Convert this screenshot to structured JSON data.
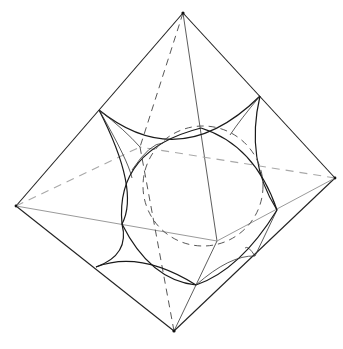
{
  "figure": {
    "title": "",
    "colors": {
      "line": "#222222",
      "hidden_light": "#a8a8a8",
      "background": "#ffffff"
    },
    "vertices": {
      "top": [
        183,
        13
      ],
      "left": [
        16,
        206
      ],
      "right": [
        335,
        178
      ],
      "bottom": [
        174,
        331
      ],
      "front": [
        217,
        241
      ],
      "back": [
        140,
        147
      ]
    },
    "truncation_corners": {
      "upper_left": [
        99,
        110
      ],
      "upper_right": [
        260,
        96
      ],
      "lower_left": [
        96,
        267
      ],
      "right_mid": [
        277,
        210
      ],
      "lower_mid": [
        196,
        285
      ],
      "lower_right": [
        255,
        256
      ]
    },
    "inscribed_circle": {
      "cx": 203,
      "cy": 186,
      "r": 60
    }
  }
}
